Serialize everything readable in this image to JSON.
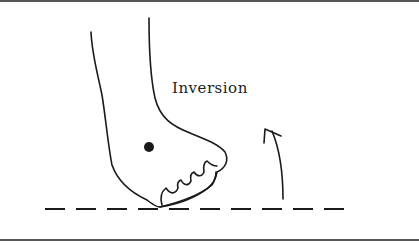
{
  "diagram": {
    "label": "Inversion",
    "colors": {
      "stroke": "#1a1a1a",
      "background": "#ffffff",
      "border": "#555555"
    },
    "elements": [
      "foot-outline",
      "toes",
      "ankle-dot",
      "ground-line-dashed",
      "rotation-arrow"
    ]
  }
}
